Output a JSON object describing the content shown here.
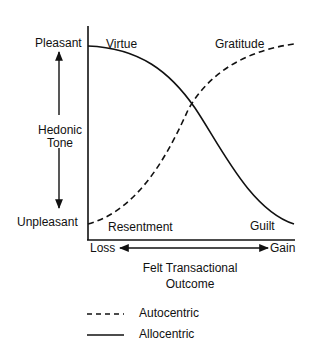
{
  "diagram": {
    "y_axis": {
      "top_label": "Pleasant",
      "bottom_label": "Unpleasant",
      "title_line1": "Hedonic",
      "title_line2": "Tone"
    },
    "x_axis": {
      "left_label": "Loss",
      "right_label": "Gain",
      "title_line1": "Felt Transactional",
      "title_line2": "Outcome"
    },
    "curve_labels": {
      "top_left": "Virtue",
      "top_right": "Gratitude",
      "bottom_left": "Resentment",
      "bottom_right": "Guilt"
    },
    "legend": [
      {
        "style": "dashed",
        "label": "Autocentric"
      },
      {
        "style": "solid",
        "label": "Allocentric"
      }
    ],
    "line_color": "#111111"
  }
}
